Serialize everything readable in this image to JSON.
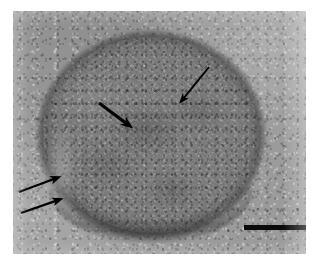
{
  "figure": {
    "domain": "Natural-Image",
    "kind": "transmission-electron-micrograph",
    "caption_text": "",
    "canvas": {
      "width": 323,
      "height": 266,
      "background_color": "#ffffff"
    }
  },
  "micrograph": {
    "alt_text": "Negative-stain transmission electron micrograph of a single large spherical virus particle",
    "frame": {
      "left": 13,
      "top": 11,
      "width": 293,
      "height": 243
    },
    "background_color": "#9b9b9b",
    "particle": {
      "label": "virus-particle",
      "shape": "roughly spherical, slightly irregular outline",
      "core_color": "#7e7e7e",
      "rim_color": "#3c3c3c",
      "center_x": 138,
      "center_y": 135,
      "diameter_px": 216
    }
  },
  "annotations": {
    "arrows": [
      {
        "id": "arrow-center-large",
        "name": "arrow-center-large",
        "description": "large thick arrow pointing down-right at the particle interior",
        "tail_x": 99,
        "tail_y": 103,
        "head_x": 134,
        "head_y": 129,
        "stroke_width": 3.2,
        "head_size": 13,
        "color": "#000000"
      },
      {
        "id": "arrow-upper-right",
        "name": "arrow-upper-right",
        "description": "thin arrow pointing down-left toward the upper-right interior",
        "tail_x": 209,
        "tail_y": 67,
        "head_x": 179,
        "head_y": 104,
        "stroke_width": 1.9,
        "head_size": 10,
        "color": "#000000"
      },
      {
        "id": "arrow-left-upper",
        "name": "arrow-left-upper",
        "description": "arrow pointing up-right at the outer envelope layer",
        "tail_x": 19,
        "tail_y": 192,
        "head_x": 62,
        "head_y": 176,
        "stroke_width": 2.3,
        "head_size": 11,
        "color": "#000000"
      },
      {
        "id": "arrow-left-lower",
        "name": "arrow-left-lower",
        "description": "arrow pointing up-right at the outer envelope layer",
        "tail_x": 21,
        "tail_y": 213,
        "head_x": 64,
        "head_y": 198,
        "stroke_width": 2.3,
        "head_size": 11,
        "color": "#000000"
      }
    ]
  },
  "scale_bar": {
    "name": "scale-bar",
    "label": "",
    "color": "#0a0a0a",
    "left": 244,
    "top": 225,
    "width": 62,
    "height": 5
  }
}
